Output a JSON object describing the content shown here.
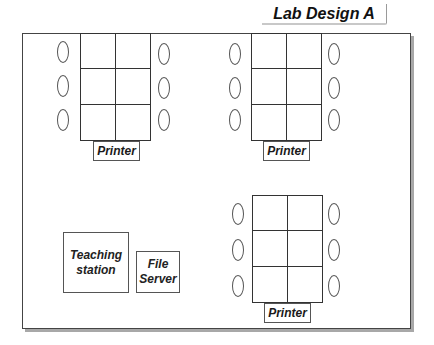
{
  "title": "Lab Design A",
  "room": {
    "table_groups": [
      {
        "id": "group-1",
        "desk": {
          "x": 80,
          "y": 33,
          "cols": 2,
          "rows": 3
        },
        "chairs_left": 3,
        "chairs_right": 3,
        "printer_label": "Printer"
      },
      {
        "id": "group-2",
        "desk": {
          "x": 251,
          "y": 33,
          "cols": 2,
          "rows": 3
        },
        "chairs_left": 3,
        "chairs_right": 3,
        "printer_label": "Printer"
      },
      {
        "id": "group-3",
        "desk": {
          "x": 252,
          "y": 195,
          "cols": 2,
          "rows": 3
        },
        "chairs_left": 3,
        "chairs_right": 3,
        "printer_label": "Printer"
      }
    ],
    "teaching_station": {
      "line1": "Teaching",
      "line2": "station"
    },
    "file_server": {
      "line1": "File",
      "line2": "Server"
    }
  },
  "colors": {
    "outline": "#333333",
    "shadow": "#a8a8a8",
    "text": "#111111"
  }
}
